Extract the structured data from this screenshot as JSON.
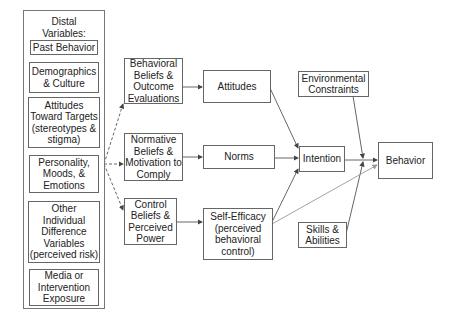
{
  "diagram": {
    "distal": {
      "title": "Distal\nVariables:",
      "items": [
        "Past Behavior",
        "Demographics\n& Culture",
        "Attitudes\nToward Targets\n(stereotypes &\nstigma)",
        "Personality,\nMoods, &\nEmotions",
        "Other\nIndividual\nDifference\nVariables\n(perceived risk)",
        "Media or\nIntervention\nExposure"
      ]
    },
    "beliefs": {
      "behavioral": "Behavioral\nBeliefs &\nOutcome\nEvaluations",
      "normative": "Normative\nBeliefs &\nMotivation to\nComply",
      "control": "Control\nBeliefs &\nPerceived\nPower"
    },
    "constructs": {
      "attitudes": "Attitudes",
      "norms": "Norms",
      "self_efficacy": "Self-Efficacy\n(perceived\nbehavioral\ncontrol)"
    },
    "intention": "Intention",
    "behavior": "Behavior",
    "environmental_constraints": "Environmental\nConstraints",
    "skills_abilities": "Skills &\nAbilities",
    "edges": [
      {
        "from": "distal",
        "to": "behavioral_beliefs",
        "style": "dashed"
      },
      {
        "from": "distal",
        "to": "normative_beliefs",
        "style": "dashed"
      },
      {
        "from": "distal",
        "to": "control_beliefs",
        "style": "dashed"
      },
      {
        "from": "behavioral_beliefs",
        "to": "attitudes",
        "style": "solid"
      },
      {
        "from": "normative_beliefs",
        "to": "norms",
        "style": "solid"
      },
      {
        "from": "control_beliefs",
        "to": "self_efficacy",
        "style": "solid"
      },
      {
        "from": "attitudes",
        "to": "intention",
        "style": "solid"
      },
      {
        "from": "norms",
        "to": "intention",
        "style": "solid"
      },
      {
        "from": "self_efficacy",
        "to": "intention",
        "style": "solid"
      },
      {
        "from": "self_efficacy",
        "to": "behavior",
        "style": "solid-light"
      },
      {
        "from": "intention",
        "to": "behavior",
        "style": "solid"
      },
      {
        "from": "environmental_constraints",
        "to": "intention-behavior-link",
        "style": "solid"
      },
      {
        "from": "skills_abilities",
        "to": "intention-behavior-link",
        "style": "solid"
      }
    ],
    "colors": {
      "stroke": "#555555",
      "light_stroke": "#999999",
      "text": "#222222"
    }
  }
}
